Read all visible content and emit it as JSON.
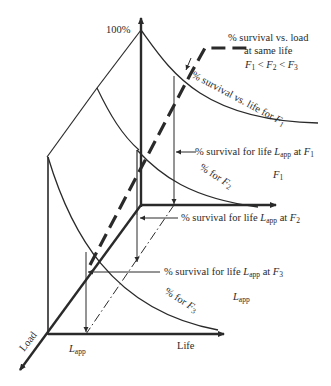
{
  "diagram": {
    "type": "3d-survival-load-life-diagram",
    "axes": {
      "vertical_top_label": "100%",
      "life_axis_label": "Life",
      "load_axis_label": "Load",
      "lapp_tick_label": "L",
      "lapp_tick_sub": "app"
    },
    "annotations": {
      "survival_vs_load": {
        "line1": "% survival vs. load",
        "line2": "at same life",
        "line3_F": "F",
        "sub1": "1",
        "lt": " < ",
        "sub2": "2",
        "sub3": "3"
      },
      "curve_F1_label": "% survival vs. life for ",
      "curve_F1_F": "F",
      "curve_F1_sub": "1",
      "curve_F2_label": "% for ",
      "curve_F2_F": "F",
      "curve_F2_sub": "2",
      "curve_F3_label": "% for ",
      "curve_F3_F": "F",
      "curve_F3_sub": "3",
      "lapp_F1": {
        "prefix": "% survival for life ",
        "L": "L",
        "sub": "app",
        "at": " at ",
        "F": "F",
        "Fsub": "1"
      },
      "lapp_F2": {
        "prefix": "% survival for life ",
        "L": "L",
        "sub": "app",
        "at": " at ",
        "F": "F",
        "Fsub": "2"
      },
      "lapp_F3": {
        "prefix": "% survival for life ",
        "L": "L",
        "sub": "app",
        "at": " at ",
        "F": "F",
        "Fsub": "3"
      },
      "plane_label_F1": {
        "F": "F",
        "sub": "1"
      },
      "plane_label_Lapp": {
        "L": "L",
        "sub": "app"
      }
    },
    "colors": {
      "line": "#2a2a2a",
      "background": "#ffffff"
    }
  }
}
